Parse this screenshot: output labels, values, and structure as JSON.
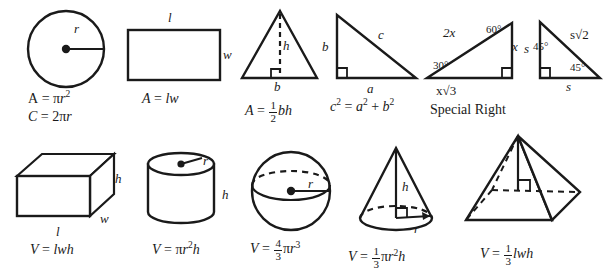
{
  "sheet": {
    "title": "Geometry Area and Volume Formula Reference",
    "ink_color": "#1a1a1a",
    "background_color": "#ffffff"
  },
  "row1": {
    "circle": {
      "name": "Circle",
      "labels": {
        "radius": "r"
      },
      "area_formula": "A = πr²",
      "circumference_formula": "C = 2πr",
      "parts": {
        "A": "A",
        "eq": "=",
        "pi": "π",
        "r": "r",
        "two": "2",
        "C": "C"
      }
    },
    "rectangle": {
      "name": "Rectangle",
      "labels": {
        "length": "l",
        "width": "w"
      },
      "area_formula": "A = lw"
    },
    "triangle": {
      "name": "Triangle",
      "labels": {
        "height": "h",
        "base": "b"
      },
      "area_formula": "A = 1/2 bh",
      "fraction": {
        "numerator": "1",
        "denominator": "2"
      }
    },
    "right_triangle": {
      "name": "Right Triangle",
      "labels": {
        "leg_b": "b",
        "hypotenuse": "c",
        "leg_a": "a"
      },
      "pythagorean_formula": "c² = a² + b²"
    },
    "triangle_30_60_90": {
      "name": "30-60-90 Special Right Triangle",
      "labels": {
        "hypotenuse": "2x",
        "short_leg": "x",
        "long_leg": "x√3",
        "angle_30": "30°",
        "angle_60": "60°"
      }
    },
    "triangle_45_45_90": {
      "name": "45-45-90 Special Right Triangle",
      "labels": {
        "leg_left": "s",
        "leg_bottom": "s",
        "hypotenuse": "s√2",
        "angle_top": "45°",
        "angle_bottom": "45°"
      }
    },
    "special_right_caption": "Special Right"
  },
  "row2": {
    "rectangular_prism": {
      "name": "Rectangular Prism",
      "labels": {
        "height": "h",
        "width": "w",
        "length": "l"
      },
      "volume_formula": "V = lwh"
    },
    "cylinder": {
      "name": "Cylinder",
      "labels": {
        "radius": "r",
        "height": "h"
      },
      "volume_formula": "V = πr²h"
    },
    "sphere": {
      "name": "Sphere",
      "labels": {
        "radius": "r"
      },
      "volume_formula": "V = 4/3 πr³",
      "fraction": {
        "numerator": "4",
        "denominator": "3"
      }
    },
    "cone": {
      "name": "Cone",
      "labels": {
        "height": "h",
        "radius": "r"
      },
      "volume_formula": "V = 1/3 πr²h",
      "fraction": {
        "numerator": "1",
        "denominator": "3"
      }
    },
    "pyramid": {
      "name": "Rectangular Pyramid",
      "labels": {},
      "volume_formula": "V = 1/3 lwh",
      "fraction": {
        "numerator": "1",
        "denominator": "3"
      }
    }
  },
  "symbols": {
    "V": "V",
    "A": "A",
    "C": "c",
    "equals": "=",
    "plus": "+",
    "pi": "π",
    "radical2": "√2",
    "radical3": "√3"
  }
}
